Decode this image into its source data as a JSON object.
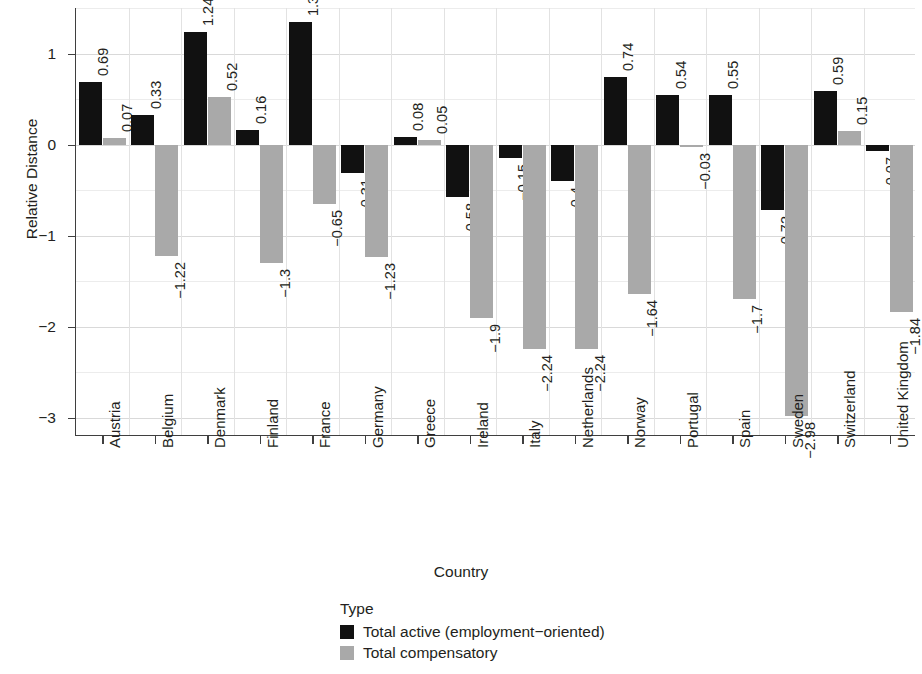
{
  "chart_data": {
    "type": "bar",
    "title": "",
    "xlabel": "Country",
    "ylabel": "Relative Distance",
    "ylim": [
      -3.2,
      1.5
    ],
    "y_ticks": [
      1,
      0,
      -1,
      -2,
      -3
    ],
    "y_tick_labels": [
      "1",
      "0",
      "−1",
      "−2",
      "−3"
    ],
    "grid": true,
    "legend_position": "bottom",
    "legend_title": "Type",
    "categories": [
      "Austria",
      "Belgium",
      "Denmark",
      "Finland",
      "France",
      "Germany",
      "Greece",
      "Ireland",
      "Italy",
      "Netherlands",
      "Norway",
      "Portugal",
      "Spain",
      "Sweden",
      "Switzerland",
      "United Kingdom"
    ],
    "series": [
      {
        "name": "Total active (employment−oriented)",
        "color": "#111111",
        "values": [
          0.69,
          0.33,
          1.24,
          0.16,
          1.35,
          -0.31,
          0.08,
          -0.58,
          -0.15,
          -0.4,
          0.74,
          0.54,
          0.55,
          -0.72,
          0.59,
          -0.07
        ],
        "labels": [
          "0.69",
          "0.33",
          "1.24",
          "0.16",
          "1.35",
          "−0.31",
          "0.08",
          "−0.58",
          "−0.15",
          "−0.4",
          "0.74",
          "0.54",
          "0.55",
          "−0.72",
          "0.59",
          "−0.07"
        ]
      },
      {
        "name": "Total compensatory",
        "color": "#a9a9a9",
        "values": [
          0.07,
          -1.22,
          0.52,
          -1.3,
          -0.65,
          -1.23,
          0.05,
          -1.9,
          -2.24,
          -1.64,
          -1.7,
          -0.03,
          -2.98,
          -1.84,
          0.15,
          -1.84
        ],
        "labels": [
          "0.07",
          "−1.22",
          "0.52",
          "−1.3",
          "−0.65",
          "−1.23",
          "0.05",
          "−1.9",
          "−2.24",
          "−1.64",
          "−1.7",
          "−0.03",
          "−2.98",
          "−1.84",
          "0.15",
          "−1.84"
        ]
      }
    ],
    "points": [
      {
        "country": "Austria",
        "active": 0.69,
        "active_label": "0.69",
        "comp": 0.07,
        "comp_label": "0.07"
      },
      {
        "country": "Belgium",
        "active": 0.33,
        "active_label": "0.33",
        "comp": -1.22,
        "comp_label": "−1.22"
      },
      {
        "country": "Denmark",
        "active": 1.24,
        "active_label": "1.24",
        "comp": 0.52,
        "comp_label": "0.52"
      },
      {
        "country": "Finland",
        "active": 0.16,
        "active_label": "0.16",
        "comp": -1.3,
        "comp_label": "−1.3"
      },
      {
        "country": "France",
        "active": 1.35,
        "active_label": "1.35",
        "comp": -0.65,
        "comp_label": "−0.65"
      },
      {
        "country": "Germany",
        "active": -0.31,
        "active_label": "−0.31",
        "comp": -1.23,
        "comp_label": "−1.23"
      },
      {
        "country": "Greece",
        "active": 0.08,
        "active_label": "0.08",
        "comp": 0.05,
        "comp_label": "0.05"
      },
      {
        "country": "Ireland",
        "active": -0.58,
        "active_label": "−0.58",
        "comp": -1.9,
        "comp_label": "−1.9"
      },
      {
        "country": "Italy",
        "active": -0.15,
        "active_label": "−0.15",
        "comp": -2.24,
        "comp_label": "−2.24"
      },
      {
        "country": "Netherlands",
        "active": -0.4,
        "active_label": "−0.4",
        "comp": -2.24,
        "comp_label": "−2.24"
      },
      {
        "country": "Norway",
        "active": 0.74,
        "active_label": "0.74",
        "comp": -1.64,
        "comp_label": "−1.64"
      },
      {
        "country": "Portugal",
        "active": 0.54,
        "active_label": "0.54",
        "comp": -0.03,
        "comp_label": "−0.03"
      },
      {
        "country": "Spain",
        "active": 0.55,
        "active_label": "0.55",
        "comp": -1.7,
        "comp_label": "−1.7"
      },
      {
        "country": "Sweden",
        "active": -0.72,
        "active_label": "−0.72",
        "comp": -2.98,
        "comp_label": "−2.98"
      },
      {
        "country": "Switzerland",
        "active": 0.59,
        "active_label": "0.59",
        "comp": 0.15,
        "comp_label": "0.15"
      },
      {
        "country": "United Kingdom",
        "active": -0.07,
        "active_label": "−0.07",
        "comp": -1.84,
        "comp_label": "−1.84"
      }
    ]
  },
  "legend": {
    "title": "Type",
    "items": [
      {
        "label": "Total active (employment−oriented)",
        "color": "#111111"
      },
      {
        "label": "Total compensatory",
        "color": "#a9a9a9"
      }
    ]
  }
}
